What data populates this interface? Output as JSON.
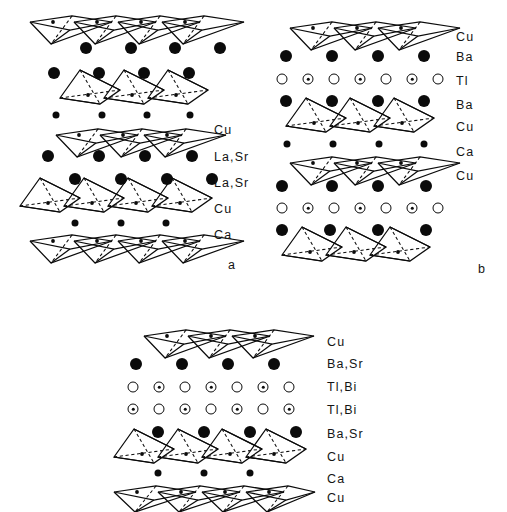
{
  "figure": {
    "type": "crystal-structure-diagram",
    "background_color": "#ffffff",
    "ink_color": "#0b0b0b"
  },
  "panels": [
    {
      "id": "a",
      "letter": "a",
      "layer_labels": [
        "Cu",
        "La,Sr",
        "La,Sr",
        "Cu",
        "Ca"
      ],
      "rows": [
        {
          "kind": "pyramids",
          "orientation": "down",
          "count": 4,
          "species": "Cu"
        },
        {
          "kind": "atoms",
          "marker": "filled-large",
          "count": 4,
          "species": "La,Sr"
        },
        {
          "kind": "atoms",
          "marker": "filled-large",
          "count": 4,
          "species": "La,Sr"
        },
        {
          "kind": "pyramids",
          "orientation": "up",
          "count": 3,
          "species": "Cu"
        },
        {
          "kind": "atoms",
          "marker": "filled-small",
          "count": 4,
          "species": "Ca"
        },
        {
          "kind": "pyramids",
          "orientation": "down",
          "count": 3,
          "species": "Cu"
        },
        {
          "kind": "atoms",
          "marker": "filled-large",
          "count": 4,
          "species": "La,Sr"
        },
        {
          "kind": "atoms",
          "marker": "filled-large",
          "count": 4,
          "species": "La,Sr"
        },
        {
          "kind": "pyramids",
          "orientation": "up",
          "count": 4,
          "species": "Cu"
        },
        {
          "kind": "atoms",
          "marker": "filled-small",
          "count": 3,
          "species": "Ca"
        },
        {
          "kind": "pyramids",
          "orientation": "down",
          "count": 4,
          "species": "Cu"
        }
      ]
    },
    {
      "id": "b",
      "letter": "b",
      "layer_labels": [
        "Cu",
        "Ba",
        "Tl",
        "Ba",
        "Cu",
        "Ca",
        "Cu"
      ],
      "rows": [
        {
          "kind": "pyramids",
          "orientation": "down",
          "count": 3,
          "species": "Cu"
        },
        {
          "kind": "atoms",
          "marker": "filled-large",
          "count": 4,
          "species": "Ba"
        },
        {
          "kind": "atoms",
          "marker": "open-dotted-alternating",
          "count": 7,
          "species": "Tl"
        },
        {
          "kind": "atoms",
          "marker": "filled-large",
          "count": 4,
          "species": "Ba"
        },
        {
          "kind": "pyramids",
          "orientation": "up",
          "count": 3,
          "species": "Cu"
        },
        {
          "kind": "atoms",
          "marker": "filled-small",
          "count": 4,
          "species": "Ca"
        },
        {
          "kind": "pyramids",
          "orientation": "down",
          "count": 3,
          "species": "Cu"
        },
        {
          "kind": "atoms",
          "marker": "filled-large",
          "count": 4,
          "species": "Ba"
        },
        {
          "kind": "atoms",
          "marker": "open-dotted-alternating",
          "count": 7,
          "species": "Tl"
        },
        {
          "kind": "atoms",
          "marker": "filled-large",
          "count": 4,
          "species": "Ba"
        },
        {
          "kind": "pyramids",
          "orientation": "up",
          "count": 3,
          "species": "Cu"
        }
      ]
    },
    {
      "id": "c",
      "letter": "",
      "layer_labels": [
        "Cu",
        "Ba,Sr",
        "Tl,Bi",
        "Tl,Bi",
        "Ba,Sr",
        "Cu",
        "Ca",
        "Cu"
      ],
      "rows": [
        {
          "kind": "pyramids",
          "orientation": "down",
          "count": 3,
          "species": "Cu"
        },
        {
          "kind": "atoms",
          "marker": "filled-large",
          "count": 4,
          "species": "Ba,Sr"
        },
        {
          "kind": "atoms",
          "marker": "open-dotted-alternating",
          "count": 7,
          "species": "Tl,Bi"
        },
        {
          "kind": "atoms",
          "marker": "dotted-open-alternating",
          "count": 7,
          "species": "Tl,Bi"
        },
        {
          "kind": "atoms",
          "marker": "filled-large",
          "count": 4,
          "species": "Ba,Sr"
        },
        {
          "kind": "pyramids",
          "orientation": "up",
          "count": 4,
          "species": "Cu"
        },
        {
          "kind": "atoms",
          "marker": "filled-small",
          "count": 3,
          "species": "Ca"
        },
        {
          "kind": "pyramids",
          "orientation": "down",
          "count": 4,
          "species": "Cu"
        }
      ]
    }
  ]
}
